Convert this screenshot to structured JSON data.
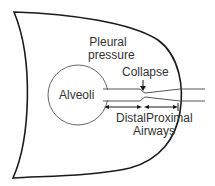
{
  "diagram": {
    "labels": {
      "pleural_line1": "Pleural",
      "pleural_line2": "pressure",
      "collapse": "Collapse",
      "alveoli": "Alveoli",
      "distal": "Distal",
      "proximal": "Proximal",
      "airways": "Airways"
    },
    "colors": {
      "stroke": "#1a1a1a",
      "tube_stroke": "#555555",
      "text": "#333333",
      "background": "#ffffff"
    },
    "nodes": [
      {
        "id": "thorax",
        "type": "outline"
      },
      {
        "id": "alveoli",
        "type": "circle",
        "label": "Alveoli"
      },
      {
        "id": "distal-airway",
        "type": "tube",
        "label": "Distal"
      },
      {
        "id": "collapse-point",
        "type": "constriction",
        "label": "Collapse"
      },
      {
        "id": "proximal-airway",
        "type": "tube",
        "label": "Proximal"
      }
    ],
    "edges": [
      {
        "from": "alveoli",
        "to": "distal-airway"
      },
      {
        "from": "distal-airway",
        "to": "collapse-point"
      },
      {
        "from": "collapse-point",
        "to": "proximal-airway"
      }
    ]
  }
}
